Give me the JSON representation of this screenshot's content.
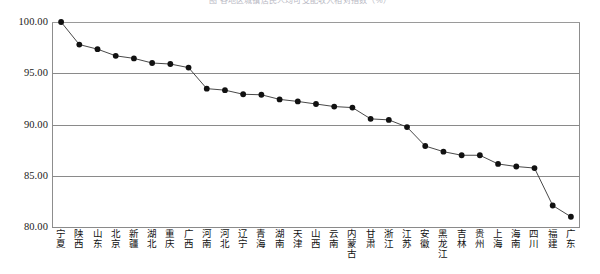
{
  "chart_data": {
    "type": "line",
    "title": "图 各地区城镇居民人均可支配收入相对指数（%）",
    "xlabel": "",
    "ylabel": "",
    "ylim": [
      80.0,
      100.0
    ],
    "yticks": [
      "80.00",
      "85.00",
      "90.00",
      "95.00",
      "100.00"
    ],
    "ytick_values": [
      80.0,
      85.0,
      90.0,
      95.0,
      100.0
    ],
    "grid": true,
    "legend": "none",
    "marker": "filled-circle",
    "line_color": "#333333",
    "marker_color": "#111111",
    "grid_color": "#8a8a8a",
    "categories": [
      "宁夏",
      "陕西",
      "山东",
      "北京",
      "新疆",
      "湖北",
      "重庆",
      "广西",
      "河南",
      "河北",
      "辽宁",
      "青海",
      "湖南",
      "天津",
      "山西",
      "云南",
      "内蒙古",
      "甘肃",
      "浙江",
      "江苏",
      "安徽",
      "黑龙江",
      "吉林",
      "贵州",
      "上海",
      "海南",
      "四川",
      "福建",
      "广东"
    ],
    "values": [
      100.0,
      97.8,
      97.35,
      96.7,
      96.45,
      96.0,
      95.9,
      95.55,
      93.5,
      93.35,
      92.95,
      92.9,
      92.45,
      92.25,
      92.0,
      91.75,
      91.65,
      90.55,
      90.45,
      89.75,
      87.9,
      87.35,
      87.0,
      87.0,
      86.15,
      85.9,
      85.75,
      82.1,
      81.0
    ]
  }
}
